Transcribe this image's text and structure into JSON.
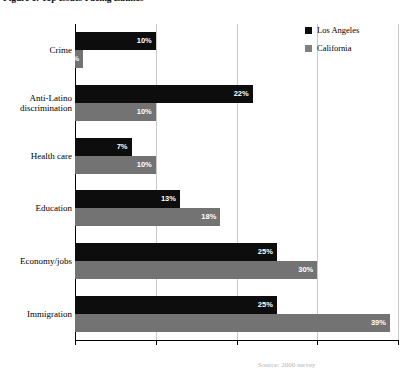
{
  "figure": {
    "title": "Figure 1: Top Issues Facing Latinos"
  },
  "legend": {
    "position": "top-right",
    "items": [
      {
        "label": "Los Angeles",
        "color": "#0d0d0d",
        "swatch": "square-swatch-icon"
      },
      {
        "label": "California",
        "color": "#737373",
        "swatch": "square-swatch-icon"
      }
    ]
  },
  "footnote": {
    "text": "Source: 2000 survey"
  },
  "chart_data": {
    "type": "bar",
    "orientation": "horizontal",
    "title": "Figure 1: Top Issues Facing Latinos",
    "xlabel": "",
    "ylabel": "",
    "xlim": [
      0,
      40
    ],
    "xticks": [
      0,
      10,
      20,
      30,
      40
    ],
    "xtick_labels": [
      "",
      "",
      "",
      "",
      ""
    ],
    "grid": true,
    "grid_axis": "x",
    "legend_position": "top-right",
    "value_suffix": "%",
    "categories": [
      "Crime",
      "Anti-Latino discrimination",
      "Health care",
      "Education",
      "Economy/jobs",
      "Immigration"
    ],
    "category_display": [
      "Crime",
      "Anti-Latino\ndiscrimination",
      "Health care",
      "Education",
      "Economy/jobs",
      "Immigration"
    ],
    "series": [
      {
        "name": "Los Angeles",
        "color": "#0d0d0d",
        "values": [
          10,
          22,
          7,
          13,
          25,
          25
        ],
        "labels": [
          "10%",
          "22%",
          "7%",
          "13%",
          "25%",
          "25%"
        ]
      },
      {
        "name": "California",
        "color": "#737373",
        "values": [
          1,
          10,
          10,
          18,
          30,
          39
        ],
        "labels": [
          "1%",
          "10%",
          "10%",
          "18%",
          "30%",
          "39%"
        ]
      }
    ]
  }
}
